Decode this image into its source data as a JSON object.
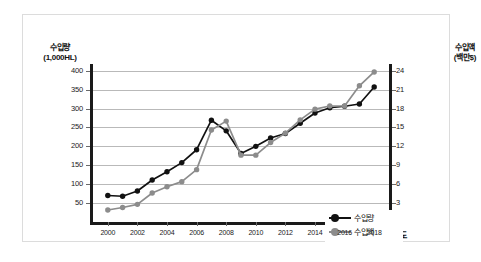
{
  "chart_data": {
    "type": "line",
    "title": "",
    "subtitle": "",
    "xlabel": "연도",
    "ylabel": "수입량",
    "ylabel_unit": "(1,000HL)",
    "y2label": "수입액",
    "y2label_unit": "(백만$)",
    "grid": true,
    "legend_position": "inside-right",
    "x": [
      2000,
      2001,
      2002,
      2003,
      2004,
      2005,
      2006,
      2007,
      2008,
      2009,
      2010,
      2011,
      2012,
      2013,
      2014,
      2015,
      2016,
      2017,
      2018
    ],
    "xlim": [
      1999,
      2019
    ],
    "xticks": [
      "2000",
      "2002",
      "2004",
      "2006",
      "2008",
      "2010",
      "2012",
      "2014",
      "2016",
      "2018"
    ],
    "xtick_values": [
      2000,
      2002,
      2004,
      2006,
      2008,
      2010,
      2012,
      2014,
      2016,
      2018
    ],
    "ylim": [
      0,
      415
    ],
    "yticks": [
      "50",
      "100",
      "150",
      "200",
      "250",
      "300",
      "350",
      "400"
    ],
    "ytick_values": [
      50,
      100,
      150,
      200,
      250,
      300,
      350,
      400
    ],
    "y2lim": [
      0,
      24.9
    ],
    "y2ticks": [
      "3",
      "6",
      "9",
      "12",
      "15",
      "18",
      "21",
      "24"
    ],
    "y2tick_values": [
      3,
      6,
      9,
      12,
      15,
      18,
      21,
      24
    ],
    "series": [
      {
        "name": "수입량",
        "axis": "left",
        "unit": "1,000HL",
        "color": "#111111",
        "marker": "circle",
        "values": [
          70,
          68,
          82,
          111,
          133,
          157,
          191,
          269,
          241,
          181,
          200,
          222,
          234,
          261,
          288,
          302,
          306,
          312,
          357
        ]
      },
      {
        "name": "수입액",
        "axis": "right",
        "unit": "백만$",
        "color": "#8c8c8c",
        "marker": "circle",
        "values": [
          1.9,
          2.3,
          2.8,
          4.6,
          5.6,
          6.4,
          8.3,
          14.6,
          16.0,
          10.6,
          10.6,
          12.6,
          14.1,
          16.2,
          17.9,
          18.4,
          18.4,
          21.6,
          23.8
        ]
      }
    ]
  },
  "legend": {
    "items": [
      {
        "label": "수입량",
        "color": "#111111"
      },
      {
        "label": "수입액",
        "color": "#8c8c8c"
      }
    ]
  }
}
